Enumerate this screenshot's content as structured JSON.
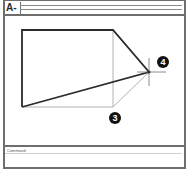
{
  "window": {
    "title_label": "A-"
  },
  "drawing": {
    "shape": "polygon",
    "vertices": {
      "top_left": [
        22,
        30
      ],
      "top_right": [
        113,
        30
      ],
      "point_4": [
        149,
        72
      ],
      "bottom_left": [
        22,
        107
      ]
    },
    "construction_lines": [
      {
        "from": [
          113,
          30
        ],
        "to": [
          113,
          107
        ]
      },
      {
        "from": [
          22,
          107
        ],
        "to": [
          113,
          107
        ]
      },
      {
        "from": [
          113,
          107
        ],
        "to": [
          149,
          72
        ]
      }
    ],
    "markers": [
      {
        "label": "4",
        "x": 163,
        "y": 62
      },
      {
        "label": "3",
        "x": 115,
        "y": 117
      }
    ],
    "crosshair": {
      "x": 149,
      "y": 72
    }
  },
  "command": {
    "prompt": "Command:"
  },
  "colors": {
    "frame": "#6e6e6e",
    "outline": "#2a2a2a",
    "construction": "#9a9a9a",
    "marker_fill": "#111111"
  }
}
